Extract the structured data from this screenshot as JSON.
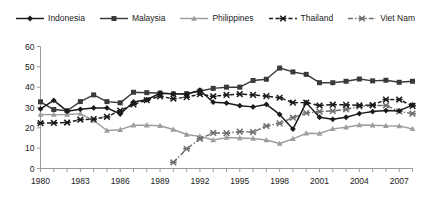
{
  "legend": {
    "position": "top-center",
    "items": [
      {
        "name": "Indonesia",
        "marker": "diamond",
        "line": "solid",
        "color": "#1a1a1a"
      },
      {
        "name": "Malaysia",
        "marker": "square",
        "line": "solid",
        "color": "#3a3a3a"
      },
      {
        "name": "Philippines",
        "marker": "triangle",
        "line": "solid",
        "color": "#9d9d9d"
      },
      {
        "name": "Thailand",
        "marker": "cross",
        "line": "dashed",
        "color": "#1a1a1a"
      },
      {
        "name": "Viet Nam",
        "marker": "cross",
        "line": "dashdot",
        "color": "#6f6f6f"
      }
    ]
  },
  "axes": {
    "y_ticks": [
      "0",
      "10",
      "20",
      "30",
      "40",
      "50",
      "60"
    ],
    "x_ticks": [
      "1980",
      "1983",
      "1986",
      "1989",
      "1992",
      "1995",
      "1998",
      "2001",
      "2004",
      "2007"
    ],
    "ylim": [
      0,
      60
    ],
    "xlim": [
      1980,
      2008
    ],
    "grid": false
  },
  "chart_data": {
    "type": "line",
    "title": "",
    "subtitle": "",
    "xlabel": "",
    "ylabel": "",
    "xlim": [
      1980,
      2008
    ],
    "ylim": [
      0,
      60
    ],
    "y_tick_values": [
      0,
      10,
      20,
      30,
      40,
      50,
      60
    ],
    "x_tick_values": [
      1980,
      1983,
      1986,
      1989,
      1992,
      1995,
      1998,
      2001,
      2004,
      2007
    ],
    "grid": false,
    "legend_position": "top-center",
    "x": [
      1980,
      1981,
      1982,
      1983,
      1984,
      1985,
      1986,
      1987,
      1988,
      1989,
      1990,
      1991,
      1992,
      1993,
      1994,
      1995,
      1996,
      1997,
      1998,
      1999,
      2000,
      2001,
      2002,
      2003,
      2004,
      2005,
      2006,
      2007,
      2008
    ],
    "series": [
      {
        "name": "Indonesia",
        "marker": "diamond",
        "line": "solid",
        "color": "#1a1a1a",
        "values": [
          29.3,
          33.5,
          28.2,
          29.1,
          29.8,
          29.8,
          26.8,
          32.7,
          33.8,
          37.0,
          36.7,
          36.6,
          38.5,
          32.6,
          32.2,
          30.9,
          30.3,
          31.5,
          26.6,
          19.4,
          32.4,
          25.2,
          24.2,
          25.2,
          27.0,
          28.0,
          28.5,
          28.3,
          31.3
        ]
      },
      {
        "name": "Malaysia",
        "marker": "square",
        "line": "solid",
        "color": "#3a3a3a",
        "values": [
          32.8,
          29.0,
          28.4,
          32.9,
          36.2,
          32.9,
          32.3,
          37.5,
          37.3,
          37.1,
          36.7,
          36.8,
          38.1,
          39.4,
          40.0,
          40.0,
          43.3,
          43.9,
          49.4,
          47.5,
          46.3,
          42.2,
          42.2,
          42.9,
          44.0,
          43.1,
          43.4,
          42.4,
          42.9
        ]
      },
      {
        "name": "Philippines",
        "marker": "triangle",
        "line": "solid",
        "color": "#9d9d9d",
        "values": [
          26.6,
          26.5,
          26.6,
          27.0,
          23.6,
          18.7,
          19.1,
          21.3,
          21.3,
          21.0,
          19.2,
          16.7,
          15.8,
          14.0,
          15.2,
          15.0,
          14.8,
          14.0,
          12.3,
          14.6,
          17.3,
          17.2,
          19.5,
          20.3,
          21.4,
          21.3,
          21.0,
          20.9,
          19.5
        ]
      },
      {
        "name": "Thailand",
        "marker": "cross",
        "line": "dashed",
        "color": "#1a1a1a",
        "values": [
          22.3,
          22.4,
          22.6,
          24.0,
          24.3,
          25.4,
          28.5,
          31.5,
          33.6,
          35.5,
          34.3,
          35.1,
          36.5,
          35.5,
          36.2,
          36.6,
          36.2,
          35.6,
          34.8,
          32.4,
          32.4,
          31.0,
          31.4,
          31.3,
          31.1,
          31.2,
          33.9,
          33.9,
          30.8
        ]
      },
      {
        "name": "Viet Nam",
        "marker": "cross",
        "line": "dashdot",
        "color": "#6f6f6f",
        "values": [
          null,
          null,
          null,
          null,
          null,
          null,
          null,
          null,
          null,
          null,
          3.0,
          9.7,
          14.6,
          17.5,
          17.4,
          18.1,
          17.9,
          20.9,
          22.2,
          25.0,
          27.3,
          28.0,
          28.3,
          29.1,
          30.5,
          31.0,
          31.0,
          28.1,
          27.0
        ]
      }
    ]
  }
}
